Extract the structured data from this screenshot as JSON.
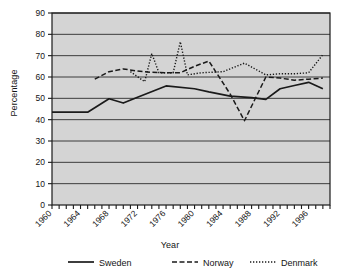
{
  "chart_data": {
    "type": "line",
    "title": "",
    "xlabel": "Year",
    "ylabel": "Percentage",
    "xlim": [
      1960,
      1999
    ],
    "ylim": [
      0,
      90
    ],
    "yticks": [
      0,
      10,
      20,
      30,
      40,
      50,
      60,
      70,
      80,
      90
    ],
    "xticks": [
      1960,
      1964,
      1968,
      1972,
      1976,
      1980,
      1984,
      1988,
      1992,
      1996
    ],
    "xtick_labels": [
      "1960",
      "1964",
      "1968",
      "1972",
      "1976",
      "1980",
      "1984",
      "1988",
      "1992",
      "1996"
    ],
    "ytick_labels": [
      "0",
      "10",
      "20",
      "30",
      "40",
      "50",
      "60",
      "70",
      "80",
      "90"
    ],
    "grid": "horizontal",
    "legend_position": "below",
    "plot_background": "#d4d4d4",
    "line_color": "#1a1a1a",
    "series": [
      {
        "name": "Sweden",
        "style": "solid",
        "x": [
          1960,
          1965,
          1968,
          1970,
          1972,
          1976,
          1980,
          1982,
          1985,
          1988,
          1990,
          1992,
          1994,
          1996,
          1998
        ],
        "values": [
          43.5,
          43.5,
          49.8,
          47.8,
          50.5,
          55.8,
          54.5,
          53.0,
          51.0,
          50.3,
          49.5,
          54.5,
          56.0,
          57.5,
          54.5
        ]
      },
      {
        "name": "Norway",
        "style": "dashed",
        "x": [
          1966,
          1968,
          1970,
          1972,
          1974,
          1976,
          1978,
          1980,
          1982,
          1985,
          1987,
          1990,
          1992,
          1994,
          1996,
          1998
        ],
        "values": [
          59.0,
          62.5,
          63.8,
          62.8,
          62.2,
          62.0,
          62.0,
          65.0,
          67.5,
          52.0,
          39.5,
          60.0,
          59.5,
          58.5,
          59.0,
          59.5
        ]
      },
      {
        "name": "Denmark",
        "style": "dotted",
        "x": [
          1971,
          1973,
          1974,
          1975,
          1977,
          1978,
          1979,
          1981,
          1984,
          1987,
          1990,
          1992,
          1994,
          1996,
          1998
        ],
        "values": [
          62.5,
          57.8,
          71.0,
          62.0,
          62.0,
          76.5,
          61.0,
          62.0,
          62.5,
          66.5,
          61.0,
          61.5,
          61.5,
          62.0,
          70.5
        ]
      }
    ]
  },
  "legend": {
    "items": [
      {
        "label": "Sweden",
        "style": "solid"
      },
      {
        "label": "Norway",
        "style": "dashed"
      },
      {
        "label": "Denmark",
        "style": "dotted"
      }
    ]
  }
}
